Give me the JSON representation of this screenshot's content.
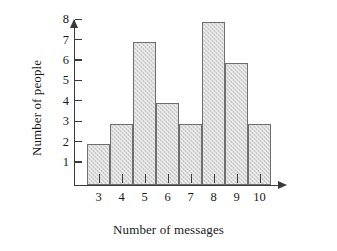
{
  "chart_data": {
    "type": "bar",
    "title": "",
    "subtitle": "",
    "xlabel": "Number of messages",
    "ylabel": "Number of people",
    "categories": [
      "3",
      "4",
      "5",
      "6",
      "7",
      "8",
      "9",
      "10"
    ],
    "values": [
      2,
      3,
      7,
      4,
      3,
      8,
      6,
      3
    ],
    "series": [
      {
        "name": "Number of people",
        "values": [
          2,
          3,
          7,
          4,
          3,
          8,
          6,
          3
        ]
      }
    ],
    "xlim": [
      2.5,
      10.5
    ],
    "ylim": [
      0,
      8
    ],
    "ytick_labels": [
      "1",
      "2",
      "3",
      "4",
      "5",
      "6",
      "7",
      "8"
    ],
    "ytick_values": [
      1,
      2,
      3,
      4,
      5,
      6,
      7,
      8
    ],
    "xtick_labels": [
      "3",
      "4",
      "5",
      "6",
      "7",
      "8",
      "9",
      "10"
    ],
    "grid": false,
    "legend": false,
    "legend_position": "none",
    "bar_gap": 0,
    "annotations": [],
    "colors": {
      "bar_fill": "#d8d8d8",
      "bar_border": "#6e6e6e",
      "axis": "#3a3a3a",
      "text": "#1a1a1a",
      "background": "#ffffff"
    },
    "axis_arrows": {
      "x_axis_arrow": true,
      "y_axis_arrow": true
    }
  }
}
